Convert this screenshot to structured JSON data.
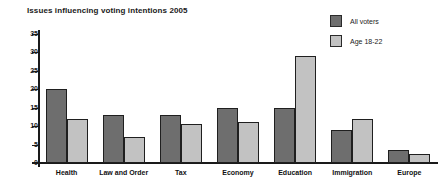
{
  "chart_data": {
    "type": "bar",
    "title": "Issues influencing voting intentions 2005",
    "xlabel": "",
    "ylabel": "",
    "ylim": [
      0,
      35
    ],
    "ytick_step": 5,
    "yticks": [
      35,
      30,
      25,
      20,
      15,
      10,
      5,
      0
    ],
    "grid": false,
    "legend_position": "top-right",
    "categories": [
      "Health",
      "Law and Order",
      "Tax",
      "Economy",
      "Education",
      "Immigration",
      "Europe"
    ],
    "series": [
      {
        "name": "All voters",
        "color": "#6e6e6e",
        "values": [
          20,
          13,
          13,
          15,
          15,
          9,
          3.5
        ]
      },
      {
        "name": "Age 18-22",
        "color": "#c2c2c2",
        "values": [
          12,
          7,
          10.5,
          11,
          29,
          12,
          2.5
        ]
      }
    ]
  },
  "legend": {
    "items": [
      {
        "label": "All voters",
        "color": "#6e6e6e"
      },
      {
        "label": "Age 18-22",
        "color": "#c2c2c2"
      }
    ]
  }
}
